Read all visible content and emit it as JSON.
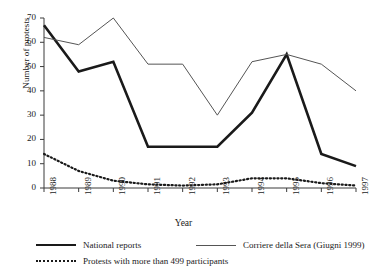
{
  "chart_data": {
    "type": "line",
    "title": "",
    "xlabel": "Year",
    "ylabel": "Number of protests",
    "categories": [
      "1988",
      "1989",
      "1990",
      "1991",
      "1992",
      "1993",
      "1994",
      "1995",
      "1996",
      "1997"
    ],
    "x": [
      1988,
      1989,
      1990,
      1991,
      1992,
      1993,
      1994,
      1995,
      1996,
      1997
    ],
    "xlim": [
      1988,
      1997
    ],
    "ylim": [
      0,
      70
    ],
    "yticks": [
      0,
      10,
      20,
      30,
      40,
      50,
      60,
      70
    ],
    "xticks": [
      "1988",
      "1989",
      "1990",
      "1991",
      "1992",
      "1993",
      "1994",
      "1995",
      "1996",
      "1997"
    ],
    "grid": false,
    "legend_position": "below",
    "series": [
      {
        "name": "National reports",
        "style": "solid-bold",
        "color": "#1a1a1a",
        "values": [
          67,
          48,
          52,
          17,
          17,
          17,
          31,
          55,
          14,
          9
        ]
      },
      {
        "name": "Corriere della Sera (Giugni 1999)",
        "style": "solid-thin",
        "color": "#555555",
        "values": [
          62,
          59,
          70,
          51,
          51,
          30,
          52,
          55,
          51,
          40
        ]
      },
      {
        "name": "Protests with more than 499 participants",
        "style": "dotted",
        "color": "#1a1a1a",
        "values": [
          14,
          7,
          3,
          1.5,
          1,
          1.5,
          4,
          4,
          2,
          1
        ]
      }
    ]
  },
  "axes": {
    "y_label": "Number of protests",
    "x_label": "Year",
    "y_ticks": [
      "0",
      "10",
      "20",
      "30",
      "40",
      "50",
      "60",
      "70"
    ],
    "x_ticks": [
      "1988",
      "1989",
      "1990",
      "1991",
      "1992",
      "1993",
      "1994",
      "1995",
      "1996",
      "1997"
    ]
  },
  "legend": {
    "items": [
      {
        "label": "National reports"
      },
      {
        "label": "Corriere della Sera (Giugni 1999)"
      },
      {
        "label": "Protests with more than 499 participants"
      }
    ]
  }
}
